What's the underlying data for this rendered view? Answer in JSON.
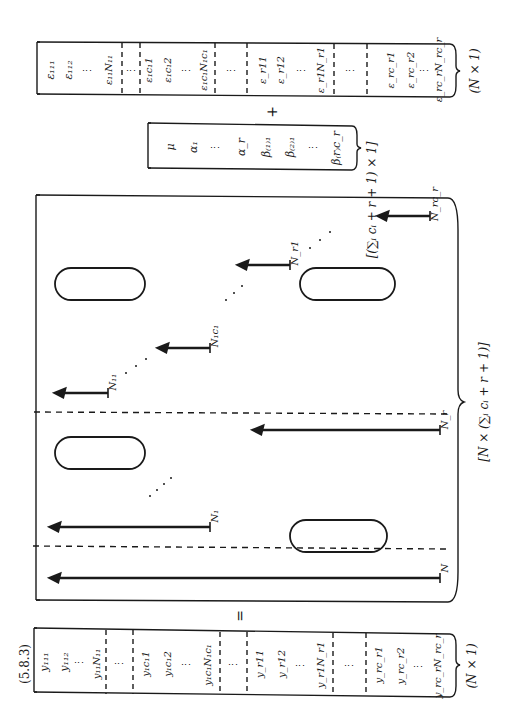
{
  "equation": {
    "number": "(5.8.3)",
    "equals_sign": "=",
    "plus_sign": "+",
    "orientation": "rotated 90° counter-clockwise"
  },
  "y_vector": {
    "dimension": "(N × 1)",
    "entries": [
      "y₁₁₁",
      "y₁₁₂",
      "⋮",
      "y₁₁N₁₁",
      "⋮",
      "y₁c₁1",
      "y₁c₁2",
      "⋮",
      "y₁c₁N₁c₁",
      "⋮",
      "y_r11",
      "y_r12",
      "⋮",
      "y_r1N_r1",
      "⋮",
      "y_rc_r1",
      "y_rc_r2",
      "⋮",
      "y_rc_rN_rc_r"
    ]
  },
  "design_matrix": {
    "dimension": "[N × (∑ᵢ cᵢ + r + 1)]",
    "column_labels": {
      "mu_column": "N",
      "alpha_first": "N₁",
      "alpha_last": "N_r",
      "beta_first": "N₁₁",
      "beta_mid1": "N₁c₁",
      "beta_mid2": "N_r1",
      "beta_last": "N_rc_r"
    }
  },
  "beta_vector": {
    "dimension": "[(∑ᵢ cᵢ + r + 1) × 1]",
    "entries": [
      "μ",
      "α₁",
      "⋮",
      "α_r",
      "β₍₁₎₁",
      "β₍₂₎₁",
      "⋮",
      "β₍r₎c_r"
    ]
  },
  "epsilon_vector": {
    "dimension": "(N × 1)",
    "entries": [
      "ε₁₁₁",
      "ε₁₁₂",
      "⋮",
      "ε₁₁N₁₁",
      "⋮",
      "ε₁c₁1",
      "ε₁c₁2",
      "⋮",
      "ε₁c₁N₁c₁",
      "⋮",
      "ε_r11",
      "ε_r12",
      "⋮",
      "ε_r1N_r1",
      "⋮",
      "ε_rc_r1",
      "ε_rc_r2",
      "⋮",
      "ε_rc_rN_rc_r"
    ]
  }
}
